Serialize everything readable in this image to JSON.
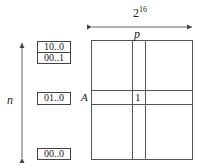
{
  "diagram": {
    "width_label_base": "2",
    "width_label_exp": "16",
    "height_label": "n",
    "column_label": "p",
    "row_label": "A",
    "cell_value": "1",
    "row_keys": [
      {
        "label": "10..0"
      },
      {
        "label": "00..1"
      },
      {
        "label": "01..0"
      },
      {
        "label": "00..0"
      }
    ]
  },
  "colors": {
    "line": "#555555",
    "text": "#222222"
  }
}
